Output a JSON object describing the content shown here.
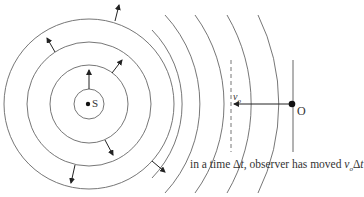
{
  "diagram": {
    "type": "doppler-moving-observer",
    "source": {
      "label": "S",
      "cx": 89,
      "cy": 104
    },
    "observer": {
      "label": "O",
      "x": 292,
      "y": 104
    },
    "velocity_label": {
      "base": "v",
      "sub": "o"
    },
    "caption": {
      "prefix": "in a time Δ",
      "t1": "t",
      "middle": ", observer has moved ",
      "v": "v",
      "sub": "o",
      "suffix": "Δ",
      "t2": "t"
    },
    "full_circle_radii": [
      15,
      39,
      62,
      85
    ],
    "arc_radii": [
      106,
      131,
      151,
      176,
      201
    ],
    "colors": {
      "stroke": "#555555",
      "dot": "#111111",
      "text": "#333333"
    }
  }
}
